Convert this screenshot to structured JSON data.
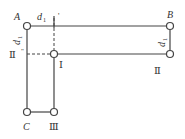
{
  "diagram": {
    "type": "linkage-frame",
    "colors": {
      "line": "#444444",
      "dashed": "#444444",
      "node_fill": "#ffffff",
      "text": "#333333"
    },
    "nodes": [
      {
        "id": "A",
        "label": "A",
        "x": 27,
        "y": 26,
        "italic": true
      },
      {
        "id": "B",
        "label": "B",
        "x": 170,
        "y": 26,
        "italic": true
      },
      {
        "id": "I",
        "label": "Ⅰ",
        "x": 54,
        "y": 54,
        "italic": false
      },
      {
        "id": "II",
        "label": "Ⅱ",
        "x": 170,
        "y": 54,
        "italic": false
      },
      {
        "id": "C",
        "label": "C",
        "x": 27,
        "y": 112,
        "italic": true
      },
      {
        "id": "III",
        "label": "Ⅲ",
        "x": 54,
        "y": 112,
        "italic": false
      }
    ],
    "labels": {
      "A": "A",
      "B": "B",
      "C": "C",
      "I": "Ⅰ",
      "II": "Ⅱ",
      "III": "Ⅲ",
      "I_prime": "Ⅰ'",
      "II_double_prime": "Ⅱ\"",
      "d1_top": "d",
      "d1_top_sub": "1",
      "d1_left": "d",
      "d1_left_sub": "1",
      "d1_right": "d",
      "d1_right_sub": "1"
    },
    "edges": [
      {
        "from": "A",
        "to": "B",
        "style": "solid"
      },
      {
        "from": "B",
        "to": "II",
        "style": "solid"
      },
      {
        "from": "I",
        "to": "II",
        "style": "solid"
      },
      {
        "from": "A",
        "to": "C",
        "style": "solid"
      },
      {
        "from": "I",
        "to": "III",
        "style": "solid"
      },
      {
        "from": "C",
        "to": "III",
        "style": "solid"
      },
      {
        "from": "I'",
        "to": "I",
        "style": "dashed"
      },
      {
        "from": "II\"",
        "to": "I",
        "style": "dashed"
      }
    ]
  }
}
